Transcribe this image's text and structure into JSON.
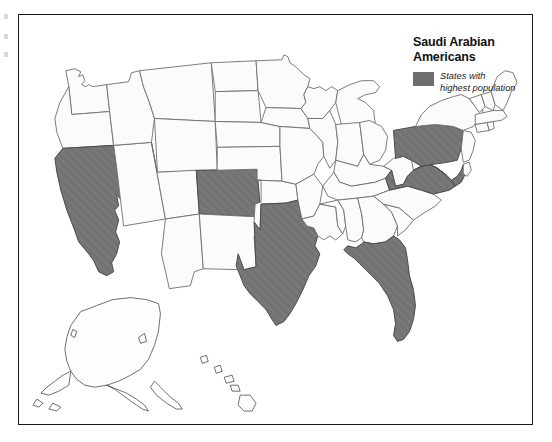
{
  "figure": {
    "kind": "choropleth-map",
    "region": "United States",
    "frame_border_color": "#1a1a1a",
    "background_color": "#ffffff"
  },
  "legend": {
    "title": "Saudi Arabian\nAmericans",
    "title_line1": "Saudi Arabian",
    "title_line2": "Americans",
    "swatch_label": "States with\nhighest population",
    "swatch_label_line1": "States with",
    "swatch_label_line2": "highest population",
    "swatch_color": "#6e6e6e",
    "swatch_name": "legend-swatch-highlighted"
  },
  "map_data": {
    "type": "choropleth",
    "title": "Saudi Arabian Americans",
    "categories": [
      "States with highest population",
      "Other states"
    ],
    "colors": {
      "highlighted": "#6e6e6e",
      "unhighlighted": "#fbfbfb",
      "state_border": "#6e6e6e",
      "outline": "#4a4a4a"
    },
    "highlighted_states": [
      "California",
      "Colorado",
      "Texas",
      "Pennsylvania",
      "Maryland",
      "Virginia",
      "Florida"
    ],
    "unhighlighted_states": [
      "Washington",
      "Oregon",
      "Idaho",
      "Nevada",
      "Montana",
      "Wyoming",
      "Utah",
      "Arizona",
      "New Mexico",
      "North Dakota",
      "South Dakota",
      "Nebraska",
      "Kansas",
      "Oklahoma",
      "Minnesota",
      "Iowa",
      "Missouri",
      "Arkansas",
      "Louisiana",
      "Wisconsin",
      "Illinois",
      "Michigan",
      "Indiana",
      "Ohio",
      "Kentucky",
      "Tennessee",
      "Mississippi",
      "Alabama",
      "Georgia",
      "South Carolina",
      "North Carolina",
      "West Virginia",
      "New York",
      "New Jersey",
      "Delaware",
      "Connecticut",
      "Rhode Island",
      "Massachusetts",
      "Vermont",
      "New Hampshire",
      "Maine",
      "Alaska",
      "Hawaii"
    ],
    "insets": [
      "Alaska",
      "Hawaii"
    ],
    "legend_position": "top-right"
  }
}
